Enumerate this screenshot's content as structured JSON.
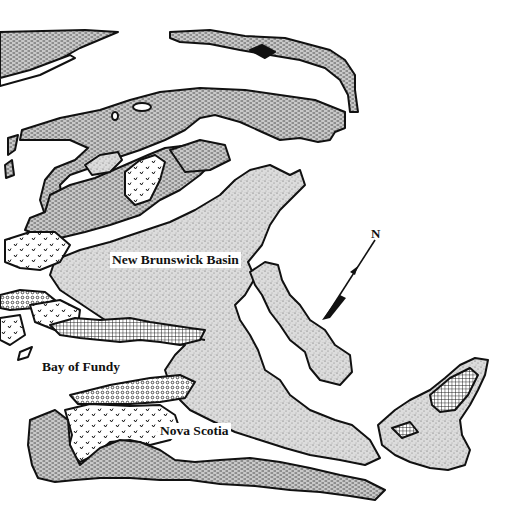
{
  "figure": {
    "type": "geologic-map",
    "region": "Maritime Canada"
  },
  "labels": {
    "new_brunswick_basin": "New Brunswick Basin",
    "bay_of_fundy": "Bay of Fundy",
    "nova_scotia": "Nova Scotia"
  },
  "north_arrow": {
    "glyph": "N",
    "icon": "north-arrow-icon"
  },
  "patterns": {
    "basin_stipple": "fine-stipple",
    "dashed_hatch": "short-dash",
    "crosshatch": "grid",
    "checks": "v-marks",
    "dots": "open-circles"
  },
  "colors": {
    "ink": "#111111",
    "paper": "#ffffff",
    "stipple_bg": "#d9d9d9",
    "dash_bg": "#c8c8c8"
  }
}
